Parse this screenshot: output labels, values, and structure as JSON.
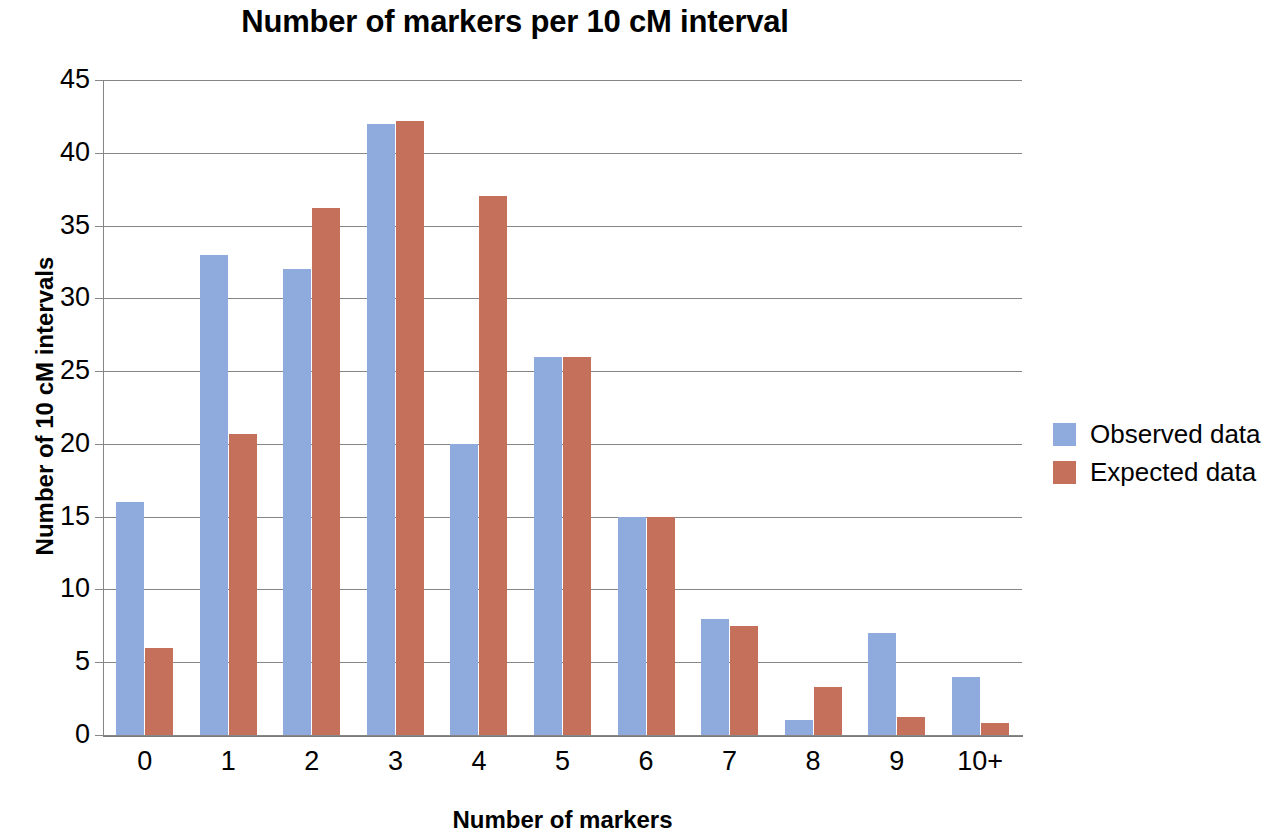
{
  "chart_data": {
    "type": "bar",
    "title": "Number of markers per 10 cM interval",
    "xlabel": "Number of markers",
    "ylabel": "Number of 10 cM intervals",
    "categories": [
      "0",
      "1",
      "2",
      "3",
      "4",
      "5",
      "6",
      "7",
      "8",
      "9",
      "10+"
    ],
    "series": [
      {
        "name": "Observed data",
        "color": "#8faadc",
        "values": [
          16,
          33,
          32,
          42,
          20,
          26,
          15,
          8,
          1,
          7,
          4
        ]
      },
      {
        "name": "Expected data",
        "color": "#c5705a",
        "values": [
          6,
          20.7,
          36.2,
          42.2,
          37,
          26,
          15,
          7.5,
          3.3,
          1.25,
          0.85
        ]
      }
    ],
    "ylim": [
      0,
      45
    ],
    "y_ticks": [
      0,
      5,
      10,
      15,
      20,
      25,
      30,
      35,
      40,
      45
    ],
    "y_tick_labels": [
      "0",
      "5",
      "10",
      "15",
      "20",
      "25",
      "30",
      "35",
      "40",
      "45"
    ],
    "grid": true,
    "grid_axis": "y",
    "legend_position": "right",
    "legend_entries": [
      "Observed data",
      "Expected data"
    ],
    "gridline_color": "#868686",
    "background": "#ffffff"
  }
}
